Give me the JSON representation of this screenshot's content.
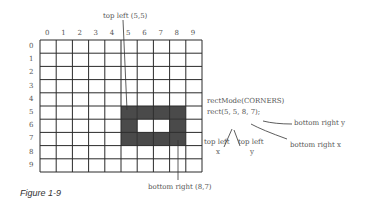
{
  "grid": {
    "columns": [
      "0",
      "1",
      "2",
      "3",
      "4",
      "5",
      "6",
      "7",
      "8",
      "9"
    ],
    "rows": [
      "0",
      "1",
      "2",
      "3",
      "4",
      "5",
      "6",
      "7",
      "8",
      "9"
    ]
  },
  "labels": {
    "top_left": "top left (5,5)",
    "bottom_right": "bottom right (8,7)",
    "code_line1": "rectMode(CORNERS)",
    "code_line2": "rect(5, 5, 8, 7);",
    "arg1": "top left",
    "arg1_sub": "x",
    "arg2": "top left",
    "arg2_sub": "y",
    "arg3": "bottom right x",
    "arg4": "bottom right y"
  },
  "caption": "Figure 1-9",
  "colors": {
    "fill": "#4a4a4a",
    "grid": "#222222",
    "text": "#555555"
  }
}
